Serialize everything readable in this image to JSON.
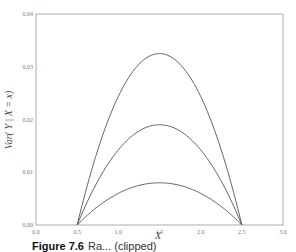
{
  "chart_data": {
    "type": "line",
    "title": "",
    "xlabel": "X",
    "ylabel": "Var( Y | X = x)",
    "xlim": [
      0.0,
      3.0
    ],
    "ylim": [
      0.0,
      0.04
    ],
    "x_ticks": [
      "0.0",
      "0.5",
      "1.0",
      "1.5",
      "2.0",
      "2.5",
      "3.0"
    ],
    "y_ticks": [
      "0.00",
      "0.01",
      "0.02",
      "0.03",
      "0.04"
    ],
    "grid": false,
    "legend": null,
    "x": [
      0.5,
      0.625,
      0.75,
      0.875,
      1.0,
      1.125,
      1.25,
      1.375,
      1.5,
      1.625,
      1.75,
      1.875,
      2.0,
      2.125,
      2.25,
      2.375,
      2.5
    ],
    "series": [
      {
        "name": "curve-high",
        "peak": 0.0325,
        "values": [
          0.0,
          0.00762,
          0.01422,
          0.0198,
          0.02438,
          0.02793,
          0.03047,
          0.03199,
          0.0325,
          0.03199,
          0.03047,
          0.02793,
          0.02438,
          0.0198,
          0.01422,
          0.00762,
          0.0
        ]
      },
      {
        "name": "curve-mid",
        "peak": 0.019,
        "values": [
          0.0,
          0.00445,
          0.00831,
          0.01158,
          0.01425,
          0.01633,
          0.01781,
          0.0187,
          0.019,
          0.0187,
          0.01781,
          0.01633,
          0.01425,
          0.01158,
          0.00831,
          0.00445,
          0.0
        ]
      },
      {
        "name": "curve-low",
        "peak": 0.008,
        "values": [
          0.0,
          0.00188,
          0.0035,
          0.00488,
          0.006,
          0.00688,
          0.0075,
          0.00788,
          0.008,
          0.00788,
          0.0075,
          0.00688,
          0.006,
          0.00488,
          0.0035,
          0.00188,
          0.0
        ]
      }
    ],
    "line_color": "#555555"
  },
  "caption": {
    "label": "Figure 7.6",
    "text": "Ra... (clipped)"
  }
}
